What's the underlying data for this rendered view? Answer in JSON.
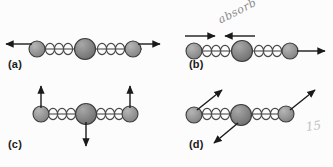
{
  "figure": {
    "background_color": "#fcfcfc",
    "atom_color_outer": "#8c8c8c",
    "atom_color_center": "#7a7a7a",
    "atom_outline_color": "#3d3d3d",
    "spring_color": "#4a4a4a",
    "arrow_color": "#1a1a1a",
    "annotation_color": "#8a8a8a"
  },
  "panels": [
    {
      "id": "a",
      "label": "(a)",
      "mode_name": "asymmetric-stretch",
      "atoms": [
        {
          "name": "left-atom",
          "radius": 8,
          "displacement": "left"
        },
        {
          "name": "center-atom",
          "radius": 10,
          "displacement": "none"
        },
        {
          "name": "right-atom",
          "radius": 8,
          "displacement": "right"
        }
      ],
      "arrows": [
        {
          "name": "left-arrow",
          "direction": "left",
          "position": "above-chain-left"
        },
        {
          "name": "right-arrow",
          "direction": "right",
          "position": "above-chain-right"
        }
      ],
      "springs": 2,
      "annotation": null
    },
    {
      "id": "b",
      "label": "(b)",
      "mode_name": "symmetric-stretch",
      "atoms": [
        {
          "name": "left-atom",
          "radius": 8,
          "displacement": "right"
        },
        {
          "name": "center-atom",
          "radius": 10,
          "displacement": "left"
        },
        {
          "name": "right-atom",
          "radius": 8,
          "displacement": "right"
        }
      ],
      "arrows": [
        {
          "name": "inward-right-arrow",
          "direction": "right",
          "position": "above-chain-left"
        },
        {
          "name": "inward-left-arrow",
          "direction": "left",
          "position": "above-chain-center"
        },
        {
          "name": "right-arrow",
          "direction": "right",
          "position": "chain-right-end"
        }
      ],
      "springs": 2,
      "annotation": "absorb"
    },
    {
      "id": "c",
      "label": "(c)",
      "mode_name": "bending-transverse",
      "atoms": [
        {
          "name": "left-atom",
          "radius": 8,
          "displacement": "up"
        },
        {
          "name": "center-atom",
          "radius": 10,
          "displacement": "down"
        },
        {
          "name": "right-atom",
          "radius": 8,
          "displacement": "up"
        }
      ],
      "arrows": [
        {
          "name": "left-up-arrow",
          "direction": "up",
          "position": "above-left-atom"
        },
        {
          "name": "center-down-arrow",
          "direction": "down",
          "position": "below-center-atom"
        },
        {
          "name": "right-up-arrow",
          "direction": "up",
          "position": "above-right-atom"
        }
      ],
      "springs": 2,
      "annotation": null
    },
    {
      "id": "d",
      "label": "(d)",
      "mode_name": "diagonal-bending",
      "atoms": [
        {
          "name": "left-atom",
          "radius": 8,
          "displacement": "up-right"
        },
        {
          "name": "center-atom",
          "radius": 10,
          "displacement": "down-left"
        },
        {
          "name": "right-atom",
          "radius": 8,
          "displacement": "up-right"
        }
      ],
      "arrows": [
        {
          "name": "left-diagonal-arrow",
          "direction": "up-right",
          "position": "from-left-atom"
        },
        {
          "name": "center-diagonal-arrow",
          "direction": "down-left",
          "position": "from-center-atom"
        },
        {
          "name": "right-diagonal-arrow",
          "direction": "up-right",
          "position": "from-right-atom"
        }
      ],
      "springs": 2,
      "annotation": "15"
    }
  ]
}
